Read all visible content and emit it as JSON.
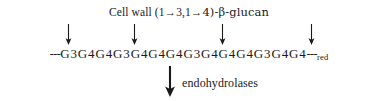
{
  "figure": {
    "width": 378,
    "height": 101,
    "background_color": "#ffffff",
    "ink_color": "#1a1a1a"
  },
  "title": {
    "full_text": "Cell wall (1→3,1→4)-β-glucan",
    "prefix": "Cell wall (1",
    "arrow1": "→",
    "mid": "3,1",
    "arrow2": "→",
    "suffix": "4)-β-glucan"
  },
  "cleavage_arrows": {
    "glyph": "down-arrow",
    "count": 4,
    "positions_x": [
      63,
      129,
      217,
      306
    ]
  },
  "sequence": {
    "left_terminus": "---",
    "right_terminus": "---",
    "reducing_end_label": "red",
    "residue_symbol": "G",
    "units": [
      {
        "residue": "G",
        "linkage": "3"
      },
      {
        "residue": "G",
        "linkage": "4"
      },
      {
        "residue": "G",
        "linkage": "4"
      },
      {
        "residue": "G",
        "linkage": "3"
      },
      {
        "residue": "G",
        "linkage": "4"
      },
      {
        "residue": "G",
        "linkage": "4"
      },
      {
        "residue": "G",
        "linkage": "4"
      },
      {
        "residue": "G",
        "linkage": "3"
      },
      {
        "residue": "G",
        "linkage": "4"
      },
      {
        "residue": "G",
        "linkage": "4"
      },
      {
        "residue": "G",
        "linkage": "4"
      },
      {
        "residue": "G",
        "linkage": "3"
      },
      {
        "residue": "G",
        "linkage": "4"
      },
      {
        "residue": "G",
        "linkage": "4"
      }
    ]
  },
  "enzyme": {
    "arrow_glyph": "down-arrow-bold",
    "label": "endohydrolases"
  }
}
